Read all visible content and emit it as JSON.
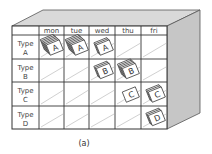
{
  "diagram": {
    "columns": [
      "mon",
      "tue",
      "wed",
      "thu",
      "fri"
    ],
    "rows": [
      {
        "label_line1": "Type",
        "label_line2": "A"
      },
      {
        "label_line1": "Type",
        "label_line2": "B"
      },
      {
        "label_line1": "Type",
        "label_line2": "C"
      },
      {
        "label_line1": "Type",
        "label_line2": "D"
      }
    ],
    "stacks": [
      {
        "row": 0,
        "col": 0,
        "letter": "A",
        "layers": 6
      },
      {
        "row": 0,
        "col": 1,
        "letter": "A",
        "layers": 6
      },
      {
        "row": 0,
        "col": 2,
        "letter": "A",
        "layers": 3
      },
      {
        "row": 1,
        "col": 2,
        "letter": "B",
        "layers": 3
      },
      {
        "row": 1,
        "col": 3,
        "letter": "B",
        "layers": 5
      },
      {
        "row": 2,
        "col": 3,
        "letter": "C",
        "layers": 1
      },
      {
        "row": 2,
        "col": 4,
        "letter": "C",
        "layers": 3
      },
      {
        "row": 3,
        "col": 4,
        "letter": "D",
        "layers": 3
      }
    ],
    "caption": "(a)",
    "colors": {
      "top_face": "#d9d9d9",
      "side_face": "#c6c6c6",
      "front_face": "#ffffff",
      "lines": "#333333"
    }
  }
}
